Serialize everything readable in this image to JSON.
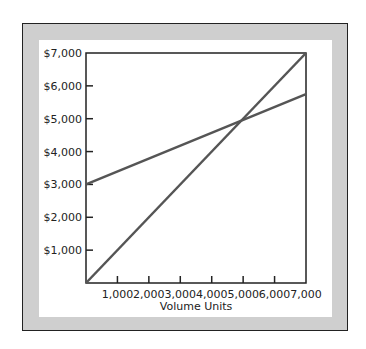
{
  "chart_data": {
    "type": "line",
    "title": "",
    "xlabel": "Volume Units",
    "ylabel": "",
    "xlim": [
      0,
      7000
    ],
    "ylim": [
      0,
      7000
    ],
    "x_ticks": [
      "1,000",
      "2,000",
      "3,000",
      "4,000",
      "5,000",
      "6,000",
      "7,000"
    ],
    "y_ticks": [
      "$1,000",
      "$2,000",
      "$3,000",
      "$4,000",
      "$5,000",
      "$6,000",
      "$7,000"
    ],
    "grid": false,
    "legend": null,
    "series": [
      {
        "name": "Total Revenue",
        "x": [
          0,
          7000
        ],
        "values": [
          0,
          7000
        ]
      },
      {
        "name": "Total Cost",
        "x": [
          0,
          7000
        ],
        "values": [
          3000,
          5750
        ]
      }
    ],
    "annotations": [
      "Lines intersect at approximately (5,000, $5,000)"
    ],
    "colors": {
      "line": "#555555",
      "frame": "#cfcfcf",
      "axis": "#222222"
    }
  }
}
